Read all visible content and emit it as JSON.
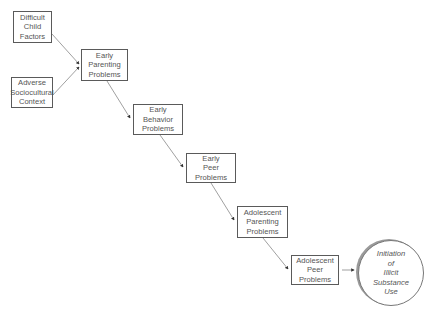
{
  "diagram": {
    "nodes": [
      {
        "id": "difficult-child-factors",
        "lines": [
          "Difficult",
          "Child",
          "Factors"
        ]
      },
      {
        "id": "adverse-sociocultural-context",
        "lines": [
          "Adverse",
          "Sociocultural",
          "Context"
        ]
      },
      {
        "id": "early-parenting-problems",
        "lines": [
          "Early",
          "Parenting",
          "Problems"
        ]
      },
      {
        "id": "early-behavior-problems",
        "lines": [
          "Early",
          "Behavior",
          "Problems"
        ]
      },
      {
        "id": "early-peer-problems",
        "lines": [
          "Early",
          "Peer",
          "Problems"
        ]
      },
      {
        "id": "adolescent-parenting-problems",
        "lines": [
          "Adolescent",
          "Parenting",
          "Problems"
        ]
      },
      {
        "id": "adolescent-peer-problems",
        "lines": [
          "Adolescent",
          "Peer",
          "Problems"
        ]
      }
    ],
    "outcome": {
      "id": "initiation-of-illicit-substance-use",
      "lines": [
        "Initiation",
        "of",
        "Illicit",
        "Substance",
        "Use"
      ]
    },
    "edges": [
      {
        "from": "difficult-child-factors",
        "to": "early-parenting-problems"
      },
      {
        "from": "adverse-sociocultural-context",
        "to": "early-parenting-problems"
      },
      {
        "from": "early-parenting-problems",
        "to": "early-behavior-problems"
      },
      {
        "from": "early-behavior-problems",
        "to": "early-peer-problems"
      },
      {
        "from": "early-peer-problems",
        "to": "adolescent-parenting-problems"
      },
      {
        "from": "adolescent-parenting-problems",
        "to": "adolescent-peer-problems"
      },
      {
        "from": "adolescent-peer-problems",
        "to": "initiation-of-illicit-substance-use"
      }
    ],
    "colors": {
      "line": "#5a5a5a",
      "text": "#555555",
      "shadow": "#9a9a9a"
    }
  }
}
